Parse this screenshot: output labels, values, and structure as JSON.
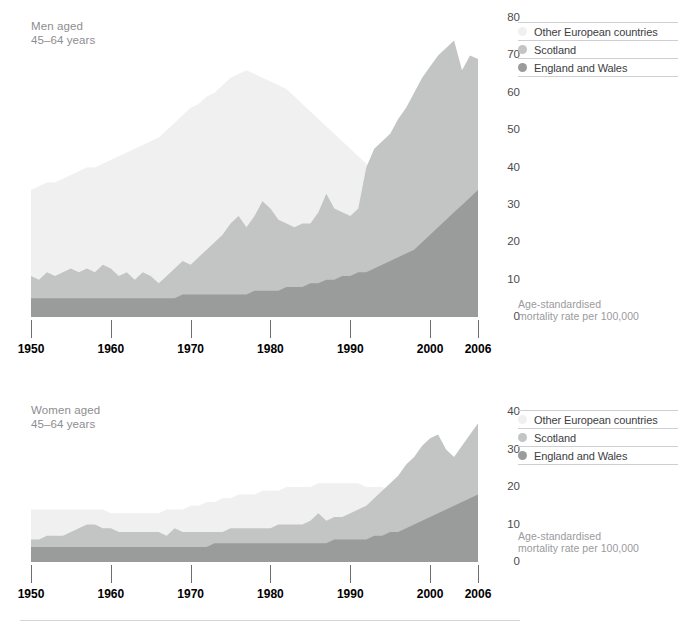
{
  "colors": {
    "other_european": "#f0f0f0",
    "scotland": "#c3c4c4",
    "england_wales": "#9a9b9b",
    "axis_text": "#4c4c4e",
    "title_text": "#8d8d90",
    "caption_text": "#9a9a9d"
  },
  "legend": {
    "items": [
      {
        "label": "Other European countries",
        "color": "#f0f0f0"
      },
      {
        "label": "Scotland",
        "color": "#c3c4c4"
      },
      {
        "label": "England and Wales",
        "color": "#9a9b9b"
      }
    ]
  },
  "caption": "Age-standardised\nmortality rate per 100,000",
  "panels": {
    "men": {
      "title": "Men aged\n45–64 years"
    },
    "women": {
      "title": "Women aged\n45–64 years"
    }
  },
  "chart_data": [
    {
      "type": "area",
      "id": "men",
      "title": "Men aged 45–64 years",
      "xlabel": "",
      "ylabel": "Age-standardised mortality rate per 100,000",
      "xlim": [
        1950,
        2006
      ],
      "ylim": [
        0,
        80
      ],
      "yticks": [
        0,
        10,
        20,
        30,
        40,
        50,
        60,
        70,
        80
      ],
      "xticks": [
        1950,
        1960,
        1970,
        1980,
        1990,
        2000,
        2006
      ],
      "grid": false,
      "legend_position": "right-top",
      "overlap": "overlaid",
      "x": [
        1950,
        1951,
        1952,
        1953,
        1954,
        1955,
        1956,
        1957,
        1958,
        1959,
        1960,
        1961,
        1962,
        1963,
        1964,
        1965,
        1966,
        1967,
        1968,
        1969,
        1970,
        1971,
        1972,
        1973,
        1974,
        1975,
        1976,
        1977,
        1978,
        1979,
        1980,
        1981,
        1982,
        1983,
        1984,
        1985,
        1986,
        1987,
        1988,
        1989,
        1990,
        1991,
        1992,
        1993,
        1994,
        1995,
        1996,
        1997,
        1998,
        1999,
        2000,
        2001,
        2002,
        2003,
        2004,
        2005,
        2006
      ],
      "series": [
        {
          "name": "Other European countries",
          "color": "#f0f0f0",
          "values": [
            34,
            35,
            36,
            36,
            37,
            38,
            39,
            40,
            40,
            41,
            42,
            43,
            44,
            45,
            46,
            47,
            48,
            50,
            52,
            54,
            56,
            57,
            59,
            60,
            62,
            64,
            65,
            66,
            65,
            64,
            63,
            62,
            61,
            59,
            57,
            55,
            53,
            51,
            49,
            47,
            45,
            43,
            41,
            40,
            38,
            36,
            34,
            32,
            30,
            28,
            26,
            25,
            23,
            22,
            20,
            19,
            18
          ]
        },
        {
          "name": "Scotland",
          "color": "#c3c4c4",
          "values": [
            11,
            10,
            12,
            11,
            12,
            13,
            12,
            13,
            12,
            14,
            13,
            11,
            12,
            10,
            12,
            11,
            9,
            11,
            13,
            15,
            14,
            16,
            18,
            20,
            22,
            25,
            27,
            24,
            27,
            31,
            29,
            26,
            25,
            24,
            25,
            25,
            28,
            33,
            29,
            28,
            27,
            29,
            40,
            45,
            47,
            49,
            53,
            56,
            60,
            64,
            67,
            70,
            72,
            74,
            66,
            70,
            69
          ]
        },
        {
          "name": "England and Wales",
          "color": "#9a9b9b",
          "values": [
            5,
            5,
            5,
            5,
            5,
            5,
            5,
            5,
            5,
            5,
            5,
            5,
            5,
            5,
            5,
            5,
            5,
            5,
            5,
            6,
            6,
            6,
            6,
            6,
            6,
            6,
            6,
            6,
            7,
            7,
            7,
            7,
            8,
            8,
            8,
            9,
            9,
            10,
            10,
            11,
            11,
            12,
            12,
            13,
            14,
            15,
            16,
            17,
            18,
            20,
            22,
            24,
            26,
            28,
            30,
            32,
            34
          ]
        }
      ]
    },
    {
      "type": "area",
      "id": "women",
      "title": "Women aged 45–64 years",
      "xlabel": "",
      "ylabel": "Age-standardised mortality rate per 100,000",
      "xlim": [
        1950,
        2006
      ],
      "ylim": [
        0,
        40
      ],
      "yticks": [
        0,
        10,
        20,
        30,
        40
      ],
      "xticks": [
        1950,
        1960,
        1970,
        1980,
        1990,
        2000,
        2006
      ],
      "grid": false,
      "legend_position": "right-top",
      "overlap": "overlaid",
      "x": [
        1950,
        1951,
        1952,
        1953,
        1954,
        1955,
        1956,
        1957,
        1958,
        1959,
        1960,
        1961,
        1962,
        1963,
        1964,
        1965,
        1966,
        1967,
        1968,
        1969,
        1970,
        1971,
        1972,
        1973,
        1974,
        1975,
        1976,
        1977,
        1978,
        1979,
        1980,
        1981,
        1982,
        1983,
        1984,
        1985,
        1986,
        1987,
        1988,
        1989,
        1990,
        1991,
        1992,
        1993,
        1994,
        1995,
        1996,
        1997,
        1998,
        1999,
        2000,
        2001,
        2002,
        2003,
        2004,
        2005,
        2006
      ],
      "series": [
        {
          "name": "Other European countries",
          "color": "#f0f0f0",
          "values": [
            14,
            14,
            14,
            14,
            14,
            14,
            14,
            14,
            14,
            14,
            13,
            13,
            13,
            13,
            13,
            13,
            13,
            14,
            14,
            14,
            15,
            15,
            16,
            16,
            17,
            17,
            18,
            18,
            18,
            19,
            19,
            19,
            20,
            20,
            20,
            20,
            21,
            21,
            21,
            21,
            21,
            21,
            20,
            20,
            20,
            19,
            19,
            18,
            18,
            17,
            17,
            16,
            16,
            15,
            14,
            14,
            13
          ]
        },
        {
          "name": "Scotland",
          "color": "#c3c4c4",
          "values": [
            6,
            6,
            7,
            7,
            7,
            8,
            9,
            10,
            10,
            9,
            9,
            8,
            8,
            8,
            8,
            8,
            8,
            7,
            9,
            8,
            8,
            8,
            8,
            8,
            8,
            9,
            9,
            9,
            9,
            9,
            9,
            10,
            10,
            10,
            10,
            11,
            13,
            11,
            12,
            12,
            13,
            14,
            15,
            17,
            19,
            21,
            23,
            26,
            28,
            31,
            33,
            34,
            30,
            28,
            31,
            34,
            37
          ]
        },
        {
          "name": "England and Wales",
          "color": "#9a9b9b",
          "values": [
            4,
            4,
            4,
            4,
            4,
            4,
            4,
            4,
            4,
            4,
            4,
            4,
            4,
            4,
            4,
            4,
            4,
            4,
            4,
            4,
            4,
            4,
            4,
            5,
            5,
            5,
            5,
            5,
            5,
            5,
            5,
            5,
            5,
            5,
            5,
            5,
            5,
            5,
            6,
            6,
            6,
            6,
            6,
            7,
            7,
            8,
            8,
            9,
            10,
            11,
            12,
            13,
            14,
            15,
            16,
            17,
            18
          ]
        }
      ]
    }
  ]
}
